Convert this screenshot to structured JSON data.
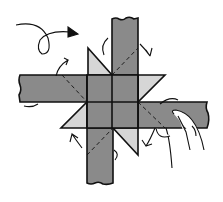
{
  "diagram": {
    "colors": {
      "strip_fill": "#8a8a8a",
      "triangle_fill": "#d6d6d6",
      "outline": "#111111",
      "background": "#ffffff"
    },
    "elements": [
      {
        "name": "top-vertical-strip",
        "type": "paper-strip"
      },
      {
        "name": "left-horizontal-strip",
        "type": "paper-strip"
      },
      {
        "name": "right-horizontal-strip",
        "type": "paper-strip"
      },
      {
        "name": "bottom-vertical-strip",
        "type": "paper-strip"
      },
      {
        "name": "center-square-grid",
        "type": "2x2 grid"
      },
      {
        "name": "star-point-triangles",
        "count": 4
      },
      {
        "name": "fold-arrows",
        "count": 5
      },
      {
        "name": "turn-over-arrow",
        "count": 1
      },
      {
        "name": "hand",
        "count": 1
      }
    ]
  }
}
